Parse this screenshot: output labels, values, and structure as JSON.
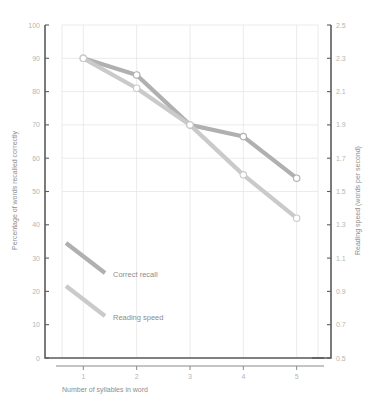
{
  "chart_data": {
    "type": "line",
    "title": "",
    "xlabel": "Number of syllables in word",
    "ylabel": "Percentage of words recalled correctly",
    "y2label": "Reading speed (words per second)",
    "x": [
      1,
      2,
      3,
      4,
      5
    ],
    "xtick_labels": [
      "1",
      "2",
      "3",
      "4",
      "5"
    ],
    "xlim": [
      0.6,
      5.4
    ],
    "ylim": [
      0,
      100
    ],
    "ytick_labels": [
      "0",
      "10",
      "20",
      "30",
      "40",
      "50",
      "60",
      "70",
      "80",
      "90",
      "100"
    ],
    "yticks": [
      0,
      10,
      20,
      30,
      40,
      50,
      60,
      70,
      80,
      90,
      100
    ],
    "y2lim": [
      0.5,
      2.5
    ],
    "y2tick_labels": [
      "0.5",
      "0.7",
      "0.9",
      "1.1",
      "1.3",
      "1.5",
      "1.7",
      "1.9",
      "2.1",
      "2.3",
      "2.5"
    ],
    "y2ticks": [
      0.5,
      0.7,
      0.9,
      1.1,
      1.3,
      1.5,
      1.7,
      1.9,
      2.1,
      2.3,
      2.5
    ],
    "grid": true,
    "legend_position": "inside-lower-left",
    "series": [
      {
        "name": "Correct recall",
        "axis": "left",
        "color": "#b0b0b0",
        "values": [
          90,
          85,
          70,
          66.5,
          54
        ]
      },
      {
        "name": "Reading speed",
        "axis": "right",
        "color": "#cacaca",
        "values_right": [
          2.3,
          2.12,
          1.9,
          1.66,
          1.32
        ],
        "values": [
          90,
          81,
          70,
          55,
          42
        ]
      }
    ],
    "colors": {
      "correct_recall": "#b0b0b0",
      "reading_speed": "#cacaca",
      "grid": "#e3e3e3",
      "axis": "#5b5b5b",
      "tick_text": "#b5b5b5",
      "title_text": "#8d8d8d",
      "background": "#ffffff"
    }
  },
  "legend": {
    "items": [
      {
        "label": "Correct recall"
      },
      {
        "label": "Reading speed"
      }
    ]
  }
}
